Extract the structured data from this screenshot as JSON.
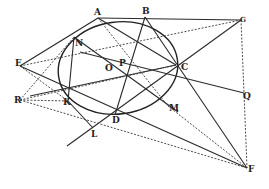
{
  "figure": {
    "type": "geometric-diagram",
    "stroke_color": "#2a2a2a",
    "background": "#ffffff",
    "labels": {
      "A": "A",
      "B": "B",
      "G": "G",
      "N": "N",
      "E": "E",
      "O": "O",
      "P": "P",
      "C": "C",
      "Q": "Q",
      "R": "R",
      "K": "K",
      "D": "D",
      "L": "L",
      "M": "M",
      "F": "F"
    }
  }
}
